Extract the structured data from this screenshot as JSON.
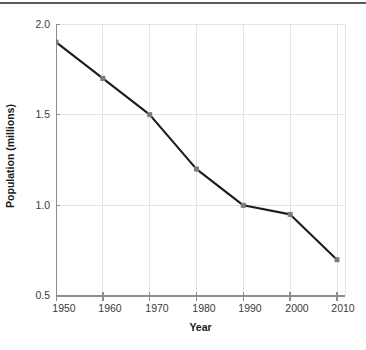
{
  "chart_data": {
    "type": "line",
    "title": "",
    "xlabel": "Year",
    "ylabel": "Population (millions)",
    "x": [
      1950,
      1960,
      1970,
      1980,
      1990,
      2000,
      2010
    ],
    "categories": [
      "1950",
      "1960",
      "1970",
      "1980",
      "1990",
      "2000",
      "2010"
    ],
    "values": [
      1.9,
      1.7,
      1.5,
      1.2,
      1.0,
      0.95,
      0.7
    ],
    "series": [
      {
        "name": "Population (millions)",
        "values": [
          1.9,
          1.7,
          1.5,
          1.2,
          1.0,
          0.95,
          0.7
        ]
      }
    ],
    "xlim": [
      1945,
      2015
    ],
    "ylim": [
      0.5,
      2.0
    ],
    "yticks": [
      0.5,
      1.0,
      1.5,
      2.0
    ],
    "ytick_labels": [
      "0.5",
      "1.0",
      "1.5",
      "2.0"
    ],
    "xticks": [
      1950,
      1960,
      1970,
      1980,
      1990,
      2000,
      2010
    ],
    "xtick_labels": [
      "1950",
      "1960",
      "1970",
      "1980",
      "1990",
      "2000",
      "2010"
    ],
    "grid": true,
    "legend": "none",
    "line_color": "#1c1c1c",
    "marker_color": "#7b7b7b",
    "marker": "square",
    "grid_color": "#e3e3e8",
    "axis_color": "#8d8d8d",
    "background": "#ffffff"
  },
  "axes": {
    "y_tick_0": "2.0",
    "y_tick_1": "1.5",
    "y_tick_2": "1.0",
    "y_tick_3": "0.5",
    "x_tick_0": "1950",
    "x_tick_1": "1960",
    "x_tick_2": "1970",
    "x_tick_3": "1980",
    "x_tick_4": "1990",
    "x_tick_5": "2000",
    "x_tick_6": "2010",
    "x_title": "Year",
    "y_title": "Population (millions)"
  }
}
